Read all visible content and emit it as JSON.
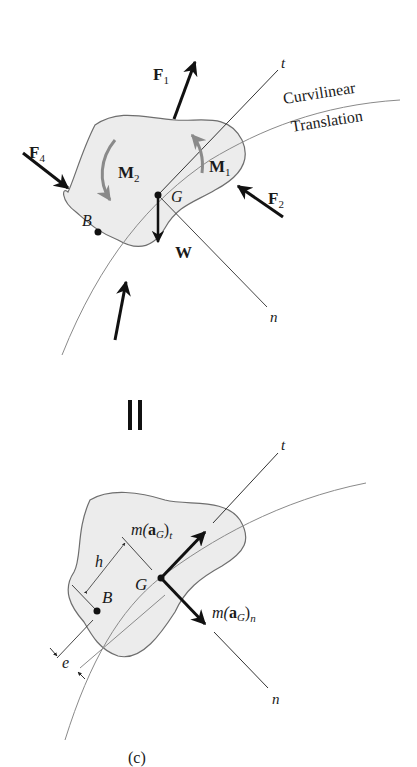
{
  "diagram": {
    "caption": "(c)",
    "equals_sign": "||",
    "free_body": {
      "forces": [
        {
          "name": "F",
          "sub": "1"
        },
        {
          "name": "F",
          "sub": "2"
        },
        {
          "name": "F",
          "sub": "4"
        },
        {
          "name": "W",
          "sub": ""
        }
      ],
      "moments": [
        {
          "name": "M",
          "sub": "1"
        },
        {
          "name": "M",
          "sub": "2"
        }
      ],
      "points": {
        "G": "G",
        "B": "B"
      },
      "axes": {
        "t": "t",
        "n": "n"
      },
      "path_label_1": "Curvilinear",
      "path_label_2": "Translation"
    },
    "kinetic": {
      "points": {
        "G": "G",
        "B": "B"
      },
      "axes": {
        "t": "t",
        "n": "n"
      },
      "vector_t": {
        "m": "m(",
        "a": "a",
        "sub_G": "G",
        "close": ")",
        "sub": "t"
      },
      "vector_n": {
        "m": "m(",
        "a": "a",
        "sub_G": "G",
        "close": ")",
        "sub": "n"
      },
      "dims": {
        "h": "h",
        "e": "e"
      }
    },
    "colors": {
      "body_fill": "#ececec",
      "outline": "#6e6e6e",
      "arrow": "#111111",
      "moment": "#8a8a8a"
    }
  }
}
